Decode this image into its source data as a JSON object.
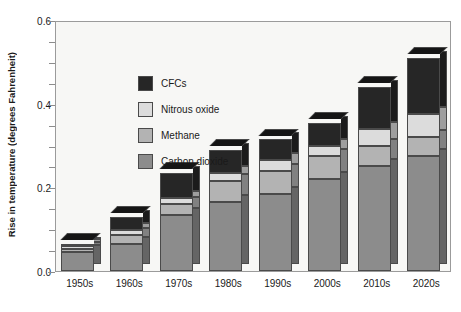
{
  "chart_data": {
    "type": "bar",
    "subtype": "stacked-column-3d",
    "title": "",
    "xlabel": "",
    "ylabel": "Rise in temperature (degrees Fahrenheit)",
    "ylim": [
      0.0,
      0.6
    ],
    "yticks": [
      "0.0",
      "0.2",
      "0.4",
      "0.6"
    ],
    "ytick_values": [
      0.0,
      0.2,
      0.4,
      0.6
    ],
    "minor_tick_step": 0.05,
    "grid": false,
    "legend_position": "upper-left-inside",
    "categories": [
      "1950s",
      "1960s",
      "1970s",
      "1980s",
      "1990s",
      "2000s",
      "2010s",
      "2020s"
    ],
    "series": [
      {
        "name": "Carbon dioxide",
        "color": "#8c8c8c",
        "values": [
          0.045,
          0.065,
          0.135,
          0.165,
          0.185,
          0.22,
          0.25,
          0.275
        ]
      },
      {
        "name": "Methane",
        "color": "#b3b3b3",
        "values": [
          0.008,
          0.02,
          0.025,
          0.05,
          0.055,
          0.055,
          0.05,
          0.045
        ]
      },
      {
        "name": "Nitrous oxide",
        "color": "#dcdcdc",
        "values": [
          0.007,
          0.013,
          0.015,
          0.02,
          0.025,
          0.025,
          0.04,
          0.055
        ]
      },
      {
        "name": "CFCs",
        "color": "#262626",
        "values": [
          0.005,
          0.032,
          0.06,
          0.055,
          0.05,
          0.055,
          0.1,
          0.135
        ]
      }
    ],
    "totals": [
      0.065,
      0.13,
      0.235,
      0.29,
      0.315,
      0.355,
      0.44,
      0.51
    ]
  },
  "legend": {
    "items": [
      {
        "label": "CFCs",
        "color": "#262626"
      },
      {
        "label": "Nitrous oxide",
        "color": "#dcdcdc"
      },
      {
        "label": "Methane",
        "color": "#b3b3b3"
      },
      {
        "label": "Carbon dioxide",
        "color": "#8c8c8c"
      }
    ]
  },
  "axes": {
    "y_title": "Rise in temperature (degrees Fahrenheit)",
    "y_tick_labels": [
      "0.6",
      "0.4",
      "0.2",
      "0.0"
    ],
    "x_tick_labels": [
      "1950s",
      "1960s",
      "1970s",
      "1980s",
      "1990s",
      "2000s",
      "2010s",
      "2020s"
    ]
  },
  "style": {
    "plot_background": "#f7f7f5",
    "frame_color": "#9b9b9b",
    "bar_outline": "#4a4a4a",
    "text_color": "#1a1a1a"
  }
}
